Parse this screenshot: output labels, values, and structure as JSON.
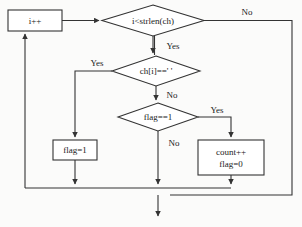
{
  "diagram": {
    "stroke_color": "#333333",
    "fill_color": "#ffffff",
    "text_color": "#1a1a1a",
    "background_color": "#fbfbfa"
  },
  "nodes": {
    "increment": {
      "label": "i++",
      "shape": "process"
    },
    "loop_condition": {
      "label": "i<strlen(ch)",
      "shape": "decision"
    },
    "space_check": {
      "label": "ch[i]==' '",
      "shape": "decision"
    },
    "flag_check": {
      "label": "flag==1",
      "shape": "decision"
    },
    "set_flag": {
      "label": "flag=1",
      "shape": "process"
    },
    "count_up": {
      "line1": "count++",
      "line2": "flag=0",
      "shape": "process"
    }
  },
  "edge_labels": {
    "loop_no": "No",
    "loop_yes": "Yes",
    "space_yes": "Yes",
    "space_no": "No",
    "flag_yes": "Yes",
    "flag_no": "No"
  }
}
